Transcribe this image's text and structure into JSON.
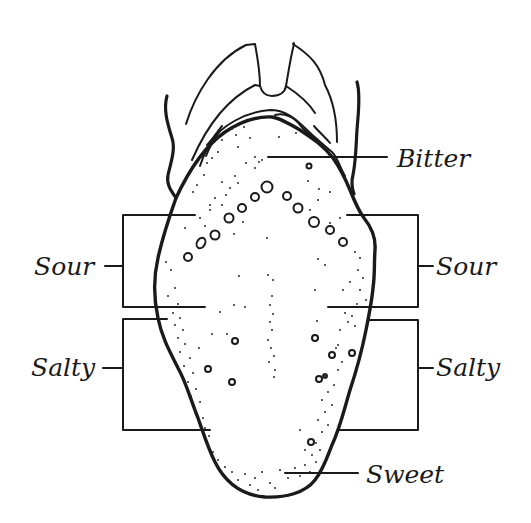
{
  "diagram": {
    "labels": {
      "bitter": "Bitter",
      "sour_left": "Sour",
      "sour_right": "Sour",
      "salty_left": "Salty",
      "salty_right": "Salty",
      "sweet": "Sweet"
    },
    "colors": {
      "ink": "#1a1a1a",
      "background": "#ffffff"
    }
  }
}
